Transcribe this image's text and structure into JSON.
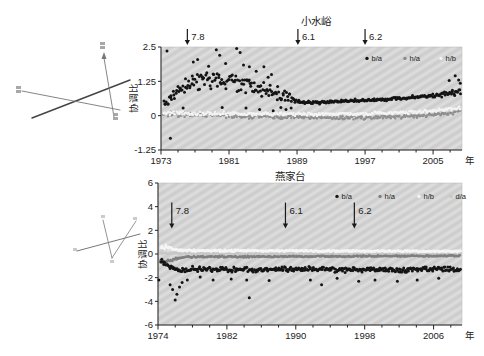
{
  "figure": {
    "background": "#ffffff",
    "text_color": "#222222",
    "plot_background": "#d4d4d4"
  },
  "chart_data": [
    {
      "type": "scatter",
      "title": "小水峪",
      "xlabel": "年",
      "ylabel": "协调比",
      "xlim": [
        1973,
        2008.4
      ],
      "ylim": [
        -1.25,
        2.5
      ],
      "xticks": [
        1973,
        1981,
        1989,
        1997,
        2005
      ],
      "yticks": [
        2.5,
        1.25,
        0,
        -1.25
      ],
      "ytick_labels": [
        "2.5",
        "1.25",
        "0",
        "-1.25"
      ],
      "grid": false,
      "minor_tick_step": 2,
      "legend_position": "top-right",
      "legend": [
        {
          "label": "b/a",
          "color": "#141414"
        },
        {
          "label": "h/a",
          "color": "#8a8a8a"
        },
        {
          "label": "h/b",
          "color": "#f4f4f4"
        }
      ],
      "events_position": "above",
      "events": [
        {
          "label": "7.8",
          "x": 1976.1
        },
        {
          "label": "6.1",
          "x": 1989.1
        },
        {
          "label": "6.2",
          "x": 1997.0
        }
      ],
      "series": [
        {
          "name": "h/a",
          "color": "#8f8f8f",
          "size": 1.2,
          "n": 310,
          "anchors": [
            [
              1973.3,
              0.05
            ],
            [
              1980,
              0.0
            ],
            [
              1989,
              -0.05
            ],
            [
              1995,
              -0.08
            ],
            [
              2000,
              -0.05
            ],
            [
              2004,
              0.0
            ],
            [
              2006.5,
              0.08
            ],
            [
              2008.4,
              0.18
            ]
          ],
          "noise": [
            [
              1973.3,
              0.12
            ],
            [
              1988.9,
              0.1
            ],
            [
              1989.2,
              0.08
            ],
            [
              2008.4,
              0.08
            ]
          ],
          "outliers": []
        },
        {
          "name": "h/b",
          "color": "#f4f4f4",
          "size": 1.2,
          "n": 300,
          "anchors": [
            [
              1973.3,
              0.1
            ],
            [
              1985,
              0.06
            ],
            [
              1995,
              0.05
            ],
            [
              2002,
              0.12
            ],
            [
              2006,
              0.2
            ],
            [
              2008.4,
              0.3
            ]
          ],
          "noise": [
            [
              1973.3,
              0.1
            ],
            [
              2008.4,
              0.07
            ]
          ],
          "outliers": []
        },
        {
          "name": "b/a",
          "color": "#141414",
          "size": 1.5,
          "n": 320,
          "anchors": [
            [
              1973.3,
              0.4
            ],
            [
              1974.3,
              0.7
            ],
            [
              1975.2,
              0.95
            ],
            [
              1976.2,
              1.1
            ],
            [
              1977.5,
              1.25
            ],
            [
              1979,
              1.3
            ],
            [
              1980.5,
              1.3
            ],
            [
              1982,
              1.2
            ],
            [
              1983.5,
              1.1
            ],
            [
              1985,
              0.95
            ],
            [
              1986.5,
              0.8
            ],
            [
              1988,
              0.62
            ],
            [
              1988.9,
              0.52
            ],
            [
              1990,
              0.48
            ],
            [
              1993,
              0.5
            ],
            [
              1996,
              0.55
            ],
            [
              1999,
              0.58
            ],
            [
              2002,
              0.65
            ],
            [
              2004,
              0.7
            ],
            [
              2006,
              0.75
            ],
            [
              2007.5,
              0.85
            ],
            [
              2008.4,
              1.0
            ]
          ],
          "noise": [
            [
              1973.3,
              0.28
            ],
            [
              1976,
              0.32
            ],
            [
              1980,
              0.38
            ],
            [
              1984,
              0.36
            ],
            [
              1987,
              0.3
            ],
            [
              1988.9,
              0.22
            ],
            [
              1989.2,
              0.07
            ],
            [
              1995,
              0.06
            ],
            [
              2001,
              0.07
            ],
            [
              2005,
              0.09
            ],
            [
              2006.5,
              0.13
            ],
            [
              2008.4,
              0.22
            ]
          ],
          "outliers": [
            [
              1973.7,
              2.35
            ],
            [
              1974.1,
              -0.82
            ],
            [
              1976.8,
              1.95
            ],
            [
              1977.3,
              2.05
            ],
            [
              1978.6,
              1.8
            ],
            [
              1979.5,
              2.4
            ],
            [
              1979.9,
              2.2
            ],
            [
              1980.6,
              1.9
            ],
            [
              1981.9,
              2.45
            ],
            [
              1982.3,
              2.3
            ],
            [
              1982.7,
              1.85
            ],
            [
              1983.4,
              1.78
            ],
            [
              1984.2,
              1.62
            ],
            [
              1985.1,
              1.78
            ],
            [
              1985.6,
              1.4
            ],
            [
              1986.0,
              1.5
            ],
            [
              1980.2,
              0.3
            ],
            [
              1983.0,
              0.28
            ],
            [
              1984.6,
              0.22
            ],
            [
              1986.2,
              0.18
            ],
            [
              1987.1,
              0.3
            ],
            [
              1987.7,
              0.22
            ],
            [
              1988.3,
              0.28
            ],
            [
              1975.6,
              0.28
            ],
            [
              2006.9,
              1.28
            ],
            [
              2007.6,
              1.45
            ],
            [
              2008.0,
              1.3
            ],
            [
              2008.2,
              1.18
            ]
          ]
        }
      ]
    },
    {
      "type": "scatter",
      "title": "燕家台",
      "xlabel": "年",
      "ylabel": "协调比",
      "xlim": [
        1974,
        2009.3
      ],
      "ylim": [
        -6,
        6
      ],
      "xticks": [
        1974,
        1982,
        1990,
        1998,
        2006
      ],
      "yticks": [
        6,
        4,
        2,
        0,
        -2,
        -4,
        -6
      ],
      "ytick_labels": [
        "6",
        "4",
        "2",
        "0",
        "-2",
        "-4",
        "-6"
      ],
      "grid": false,
      "minor_tick_step": 2,
      "legend_position": "top-right",
      "legend": [
        {
          "label": "b/a",
          "color": "#141414"
        },
        {
          "label": "h/a",
          "color": "#7f7f7f"
        },
        {
          "label": "h/b",
          "color": "#f5f5f5"
        },
        {
          "label": "d/a",
          "color": "#c7c7c7"
        }
      ],
      "events_position": "inside",
      "events": [
        {
          "label": "7.8",
          "x": 1975.6
        },
        {
          "label": "6.1",
          "x": 1988.8
        },
        {
          "label": "6.2",
          "x": 1996.8
        }
      ],
      "series": [
        {
          "name": "d/a",
          "color": "#c7c7c7",
          "size": 1.2,
          "n": 300,
          "anchors": [
            [
              1974.3,
              0.06
            ],
            [
              2009.3,
              0.0
            ]
          ],
          "noise": [
            [
              1974.3,
              0.07
            ],
            [
              2009.3,
              0.05
            ]
          ],
          "outliers": []
        },
        {
          "name": "h/a",
          "color": "#7f7f7f",
          "size": 1.3,
          "n": 320,
          "anchors": [
            [
              1974.3,
              -0.5
            ],
            [
              1974.8,
              -0.7
            ],
            [
              1975.5,
              -0.5
            ],
            [
              1976.5,
              -0.32
            ],
            [
              1978,
              -0.25
            ],
            [
              1985,
              -0.22
            ],
            [
              1995,
              -0.2
            ],
            [
              2009.3,
              -0.15
            ]
          ],
          "noise": [
            [
              1974.3,
              0.2
            ],
            [
              1976.5,
              0.1
            ],
            [
              2009.3,
              0.06
            ]
          ],
          "outliers": []
        },
        {
          "name": "h/b",
          "color": "#f5f5f5",
          "size": 1.4,
          "n": 320,
          "anchors": [
            [
              1974.3,
              0.5
            ],
            [
              1974.9,
              0.62
            ],
            [
              1975.6,
              0.45
            ],
            [
              1976.5,
              0.32
            ],
            [
              1978,
              0.28
            ],
            [
              1990,
              0.26
            ],
            [
              2009.3,
              0.22
            ]
          ],
          "noise": [
            [
              1974.3,
              0.2
            ],
            [
              1976.5,
              0.1
            ],
            [
              2009.3,
              0.07
            ]
          ],
          "outliers": []
        },
        {
          "name": "b/a",
          "color": "#141414",
          "size": 1.5,
          "n": 330,
          "anchors": [
            [
              1974.4,
              -0.5
            ],
            [
              1974.9,
              -0.85
            ],
            [
              1975.4,
              -1.1
            ],
            [
              1976.2,
              -1.3
            ],
            [
              1978,
              -1.3
            ],
            [
              1980,
              -1.25
            ],
            [
              1982,
              -1.35
            ],
            [
              1984,
              -1.3
            ],
            [
              1986,
              -1.35
            ],
            [
              1988,
              -1.25
            ],
            [
              1990,
              -1.3
            ],
            [
              1993,
              -1.25
            ],
            [
              1996,
              -1.35
            ],
            [
              1999,
              -1.3
            ],
            [
              2002,
              -1.35
            ],
            [
              2005,
              -1.3
            ],
            [
              2007,
              -1.25
            ],
            [
              2009.3,
              -1.3
            ]
          ],
          "noise": [
            [
              1974.4,
              0.3
            ],
            [
              1976.5,
              0.35
            ],
            [
              1979,
              0.28
            ],
            [
              2009.3,
              0.25
            ]
          ],
          "outliers": [
            [
              1974.1,
              -2.2
            ],
            [
              1975.4,
              -2.6
            ],
            [
              1975.7,
              -3.0
            ],
            [
              1976.0,
              -3.9
            ],
            [
              1976.2,
              -3.4
            ],
            [
              1976.5,
              -2.8
            ],
            [
              1976.8,
              -2.4
            ],
            [
              1977.4,
              -2.2
            ],
            [
              1978.9,
              -1.95
            ],
            [
              1980.4,
              -2.2
            ],
            [
              1982.5,
              -2.1
            ],
            [
              1984.3,
              -2.2
            ],
            [
              1984.6,
              -3.7
            ],
            [
              1986.9,
              -2.25
            ],
            [
              1991.7,
              -2.2
            ],
            [
              1993.0,
              -2.6
            ],
            [
              1994.8,
              -2.05
            ],
            [
              1997.3,
              -2.3
            ],
            [
              1999.2,
              -2.2
            ],
            [
              2001.8,
              -2.3
            ],
            [
              2004.1,
              -2.2
            ],
            [
              2006.6,
              -2.05
            ]
          ]
        }
      ]
    }
  ]
}
